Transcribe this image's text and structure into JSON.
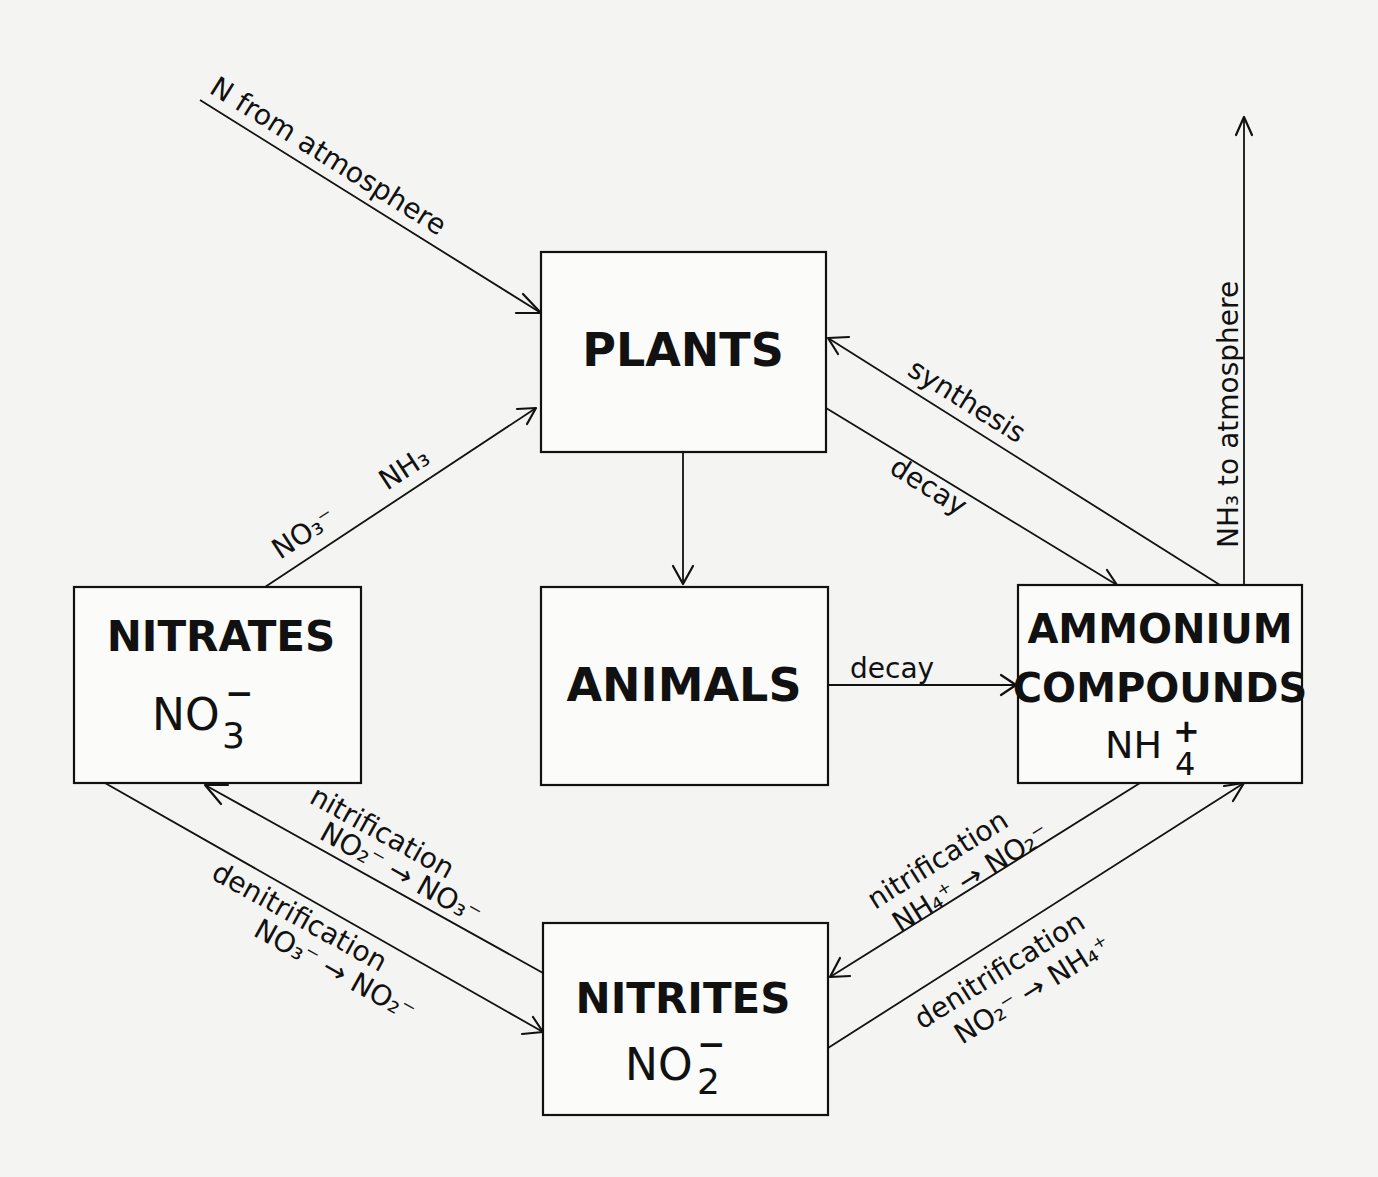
{
  "diagram": {
    "kind": "nitrogen cycle",
    "nodes": {
      "plants": {
        "title": "PLANTS"
      },
      "animals": {
        "title": "ANIMALS"
      },
      "nitrates": {
        "title": "NITRATES",
        "formula_base": "NO",
        "formula_sub": "3",
        "formula_sup": "−"
      },
      "ammonium": {
        "title_line1": "AMMONIUM",
        "title_line2": "COMPOUNDS",
        "formula_base": "NH",
        "formula_sub": "4",
        "formula_sup": "+"
      },
      "nitrites": {
        "title": "NITRITES",
        "formula_base": "NO",
        "formula_sub": "2",
        "formula_sup": "−"
      }
    },
    "edges": {
      "atmosphere_to_plants": {
        "label": "N  from atmosphere"
      },
      "nitrates_to_plants": {
        "label_a": "NO₃⁻",
        "label_b": "NH₃"
      },
      "plants_to_animals": {
        "label": ""
      },
      "ammonium_to_plants": {
        "label": "synthesis"
      },
      "plants_to_ammonium": {
        "label": "decay"
      },
      "animals_to_ammonium": {
        "label": "decay"
      },
      "ammonium_to_atmosphere": {
        "label": "NH₃ to atmosphere"
      },
      "nitrites_to_nitrates": {
        "label": "nitrification",
        "reaction": "NO₂⁻ → NO₃⁻"
      },
      "nitrates_to_nitrites": {
        "label": "denitrification",
        "reaction": "NO₃⁻ → NO₂⁻"
      },
      "ammonium_to_nitrites": {
        "label": "nitrification",
        "reaction": "NH₄⁺ → NO₂⁻"
      },
      "nitrites_to_ammonium": {
        "label": "denitrification",
        "reaction": "NO₂⁻ → NH₄⁺"
      }
    }
  }
}
